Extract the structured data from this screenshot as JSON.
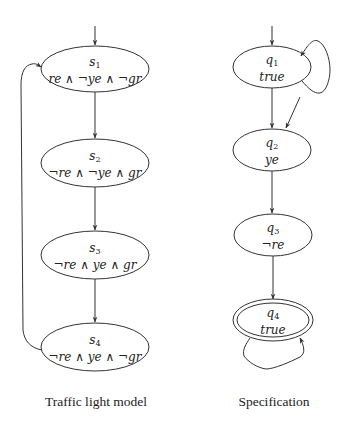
{
  "colors": {
    "stroke": "#333333",
    "text": "#222222",
    "background": "#ffffff"
  },
  "traffic_model": {
    "caption": "Traffic light model",
    "states": [
      {
        "id": "s1",
        "name": "s",
        "index": "1",
        "label": "re ∧ ¬ye ∧ ¬gr",
        "initial": true
      },
      {
        "id": "s2",
        "name": "s",
        "index": "2",
        "label": "¬re ∧ ¬ye ∧ gr"
      },
      {
        "id": "s3",
        "name": "s",
        "index": "3",
        "label": "¬re ∧ ye ∧ gr"
      },
      {
        "id": "s4",
        "name": "s",
        "index": "4",
        "label": "¬re ∧ ye ∧ ¬gr"
      }
    ],
    "transitions": [
      {
        "from": "s1",
        "to": "s2"
      },
      {
        "from": "s2",
        "to": "s3"
      },
      {
        "from": "s3",
        "to": "s4"
      },
      {
        "from": "s4",
        "to": "s1"
      }
    ]
  },
  "specification": {
    "caption": "Specification",
    "states": [
      {
        "id": "q1",
        "name": "q",
        "index": "1",
        "label": "true",
        "initial": true
      },
      {
        "id": "q2",
        "name": "q",
        "index": "2",
        "label": "ye"
      },
      {
        "id": "q3",
        "name": "q",
        "index": "3",
        "label": "¬re"
      },
      {
        "id": "q4",
        "name": "q",
        "index": "4",
        "label": "true",
        "accepting": true
      }
    ],
    "transitions": [
      {
        "from": "q1",
        "to": "q1"
      },
      {
        "from": "q1",
        "to": "q2"
      },
      {
        "from": "q2",
        "to": "q3"
      },
      {
        "from": "q3",
        "to": "q4"
      },
      {
        "from": "q4",
        "to": "q4"
      }
    ]
  }
}
